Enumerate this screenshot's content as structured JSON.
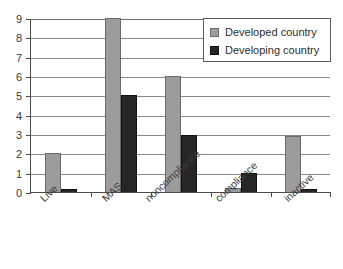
{
  "chart_data": {
    "type": "bar",
    "title": "",
    "xlabel": "",
    "ylabel": "",
    "categories": [
      "Live",
      "MAS",
      "noncompliance",
      "compliance",
      "inactive"
    ],
    "series": [
      {
        "name": "Developed country",
        "color": "#9c9c9c",
        "values": [
          2,
          9,
          6,
          0.2,
          2.9
        ]
      },
      {
        "name": "Developing country",
        "color": "#262626",
        "values": [
          0.15,
          5,
          2.95,
          1,
          0.15
        ]
      }
    ],
    "ylim": [
      0,
      9
    ],
    "yticks": [
      0,
      1,
      2,
      3,
      4,
      5,
      6,
      7,
      8,
      9
    ],
    "ytick_labels": [
      "0",
      "1",
      "2",
      "3",
      "4",
      "5",
      "6",
      "7",
      "8",
      "9"
    ],
    "grid": true,
    "grid_axis": "y",
    "legend_position": "top-right",
    "xtick_label_rotation": -43
  },
  "legend": {
    "entries": [
      {
        "label": "Developed country",
        "swatch": "developed"
      },
      {
        "label": "Developing country",
        "swatch": "developing"
      }
    ]
  },
  "axis": {
    "y_tick_labels": [
      "9",
      "8",
      "7",
      "6",
      "5",
      "4",
      "3",
      "2",
      "1",
      "0"
    ],
    "x_tick_labels": [
      "Live",
      "MAS",
      "noncompliance",
      "compliance",
      "inactive"
    ]
  }
}
